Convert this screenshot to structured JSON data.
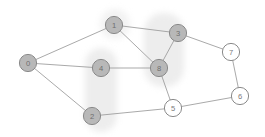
{
  "figure": {
    "type": "node-link-graph",
    "width": 265,
    "height": 137,
    "background": "#ffffff"
  },
  "style": {
    "node_radius": 8.6,
    "node_fill_filled": "#b8b8b8",
    "node_fill_empty": "#ffffff",
    "node_stroke": "#8a8a8a",
    "node_stroke_width": 1.0,
    "label_color_filled": "#6e6e6e",
    "label_color_empty": "#7a7a7a",
    "label_font_size": 7.6,
    "edge_stroke": "#9a9a9a",
    "edge_stroke_width": 0.85,
    "highlight_fill": "#ededed",
    "highlight_fill_soft": "#f2f2f2"
  },
  "nodes": [
    {
      "id": "0",
      "label": "0",
      "x": 28,
      "y": 63,
      "filled": true,
      "highlighted": false
    },
    {
      "id": "1",
      "label": "1",
      "x": 114,
      "y": 25,
      "filled": true,
      "highlighted": true
    },
    {
      "id": "2",
      "label": "2",
      "x": 92,
      "y": 116,
      "filled": true,
      "highlighted": true
    },
    {
      "id": "3",
      "label": "3",
      "x": 178,
      "y": 33,
      "filled": true,
      "highlighted": true
    },
    {
      "id": "4",
      "label": "4",
      "x": 101,
      "y": 68,
      "filled": true,
      "highlighted": true
    },
    {
      "id": "5",
      "label": "5",
      "x": 173,
      "y": 108,
      "filled": false,
      "highlighted": false
    },
    {
      "id": "6",
      "label": "6",
      "x": 240,
      "y": 96,
      "filled": false,
      "highlighted": false
    },
    {
      "id": "7",
      "label": "7",
      "x": 231,
      "y": 52,
      "filled": false,
      "highlighted": false
    },
    {
      "id": "8",
      "label": "8",
      "x": 159,
      "y": 68,
      "filled": true,
      "highlighted": true
    }
  ],
  "edges": [
    {
      "source": "0",
      "target": "1"
    },
    {
      "source": "0",
      "target": "4"
    },
    {
      "source": "0",
      "target": "2"
    },
    {
      "source": "1",
      "target": "3"
    },
    {
      "source": "1",
      "target": "8"
    },
    {
      "source": "3",
      "target": "8"
    },
    {
      "source": "3",
      "target": "7"
    },
    {
      "source": "4",
      "target": "8"
    },
    {
      "source": "8",
      "target": "5"
    },
    {
      "source": "2",
      "target": "5"
    },
    {
      "source": "5",
      "target": "6"
    },
    {
      "source": "6",
      "target": "7"
    }
  ],
  "highlight_regions": [
    {
      "name": "cluster-band-center-left",
      "x": 85,
      "y": 48,
      "width": 32,
      "height": 84,
      "radius": 16,
      "fill": "#ededed"
    },
    {
      "name": "cluster-band-center-right",
      "x": 144,
      "y": 13,
      "width": 40,
      "height": 74,
      "radius": 19,
      "fill": "#ededed"
    },
    {
      "name": "cluster-blob-top-left",
      "x": 100,
      "y": 9,
      "width": 30,
      "height": 30,
      "radius": 15,
      "fill": "#f2f2f2"
    }
  ]
}
